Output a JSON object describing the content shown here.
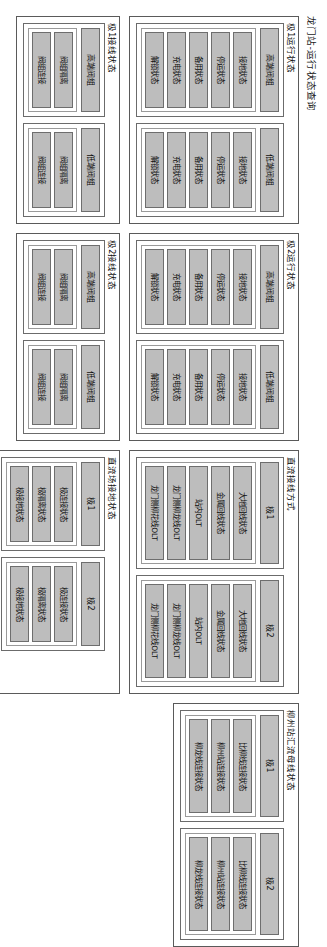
{
  "page": {
    "title": "龙门站-运行状态查询"
  },
  "groups": [
    {
      "id": "pole1-operation",
      "title": "极1运行状态",
      "subs": [
        {
          "label": "高端阀组",
          "items": [
            "接地状态",
            "停运状态",
            "备用状态",
            "充电状态",
            "解锁状态"
          ]
        },
        {
          "label": "低端阀组",
          "items": [
            "接地状态",
            "停运状态",
            "备用状态",
            "充电状态",
            "解锁状态"
          ]
        }
      ]
    },
    {
      "id": "pole2-operation",
      "title": "极2运行状态",
      "subs": [
        {
          "label": "高端阀组",
          "items": [
            "接地状态",
            "停运状态",
            "备用状态",
            "充电状态",
            "解锁状态"
          ]
        },
        {
          "label": "低端阀组",
          "items": [
            "接地状态",
            "停运状态",
            "备用状态",
            "充电状态",
            "解锁状态"
          ]
        }
      ]
    },
    {
      "id": "dc-wiring-mode",
      "title": "直流接线方式",
      "subs": [
        {
          "label": "极1",
          "items": [
            "大地回线状态",
            "金属回线状态",
            "站内OLT",
            "龙门侧柳龙线OLT",
            "龙门侧柳花线OLT"
          ]
        },
        {
          "label": "极2",
          "items": [
            "大地回线状态",
            "金属回线状态",
            "站内OLT",
            "龙门侧柳龙线OLT",
            "龙门侧柳花线OLT"
          ]
        }
      ]
    },
    {
      "id": "liuzhou-busbar",
      "title": "柳州站汇流母线状态",
      "subs": [
        {
          "label": "极1",
          "items": [
            "比柳线连接状态",
            "柳州站连接状态",
            "柳龙线连接状态"
          ]
        },
        {
          "label": "极2",
          "items": [
            "比柳线连接状态",
            "柳州站连接状态",
            "柳龙线连接状态"
          ]
        }
      ]
    },
    {
      "id": "pole1-wiring",
      "title": "极1接线状态",
      "subs": [
        {
          "label": "高端阀组",
          "items": [
            "阀组隔离",
            "阀组连接"
          ]
        },
        {
          "label": "低端阀组",
          "items": [
            "阀组隔离",
            "阀组连接"
          ]
        }
      ]
    },
    {
      "id": "pole2-wiring",
      "title": "极2接线状态",
      "subs": [
        {
          "label": "高端阀组",
          "items": [
            "阀组隔离",
            "阀组连接"
          ]
        },
        {
          "label": "低端阀组",
          "items": [
            "阀组隔离",
            "阀组连接"
          ]
        }
      ]
    },
    {
      "id": "dc-yard-grounding",
      "title": "直流场接地状态",
      "subs": [
        {
          "label": "极1",
          "items": [
            "极连接状态",
            "极隔离状态",
            "极接地状态"
          ]
        },
        {
          "label": "极2",
          "items": [
            "极连接状态",
            "极隔离状态",
            "极接地状态"
          ]
        }
      ]
    },
    {
      "id": "ground-electrode",
      "title": "接地极状态",
      "subs": [
        {
          "label": "接地极状态",
          "items": [
            "连接状态",
            "隔离状态"
          ]
        }
      ]
    }
  ],
  "layout": {
    "columns": [
      [
        "pole1-operation",
        "pole1-wiring"
      ],
      [
        "pole2-operation",
        "pole2-wiring"
      ],
      [
        "dc-wiring-mode",
        "dc-yard-grounding",
        "ground-electrode"
      ],
      [
        "liuzhou-busbar"
      ]
    ]
  },
  "colors": {
    "tile_fill": "#bdbdbd",
    "tile_border": "#6e6e6e",
    "panel_border": "#5a5a5a",
    "background": "#ffffff",
    "text": "#0d0d0d"
  }
}
